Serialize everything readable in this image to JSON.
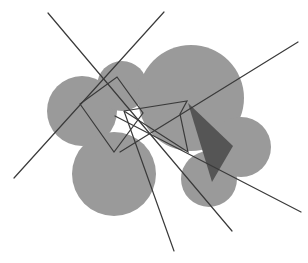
{
  "figure": {
    "title": "",
    "width": 308,
    "height": 263,
    "background_color": "#ffffff"
  },
  "colors": {
    "disc_fill": "#9a9a9a",
    "dark_triangle_fill": "#555555",
    "line_stroke": "#3a3a3a",
    "polygon_stroke": "#3a3a3a",
    "background": "#ffffff"
  },
  "chart_data": {
    "type": "scatter",
    "title": "",
    "xlabel": "",
    "ylabel": "",
    "xlim": [
      0,
      308
    ],
    "ylim": [
      0,
      263
    ],
    "grid": false,
    "legend": null,
    "discs": [
      {
        "name": "disc-left",
        "cx": 82,
        "cy": 111,
        "r": 35
      },
      {
        "name": "disc-top-small",
        "cx": 122,
        "cy": 86,
        "r": 25
      },
      {
        "name": "disc-top-right-large",
        "cx": 191,
        "cy": 98,
        "r": 53
      },
      {
        "name": "disc-bottom-left-large",
        "cx": 114,
        "cy": 174,
        "r": 42
      },
      {
        "name": "disc-bottom-middle",
        "cx": 209,
        "cy": 179,
        "r": 28
      },
      {
        "name": "disc-right",
        "cx": 241,
        "cy": 147,
        "r": 30
      }
    ],
    "dark_triangle": {
      "name": "dark-triangle",
      "points": [
        [
          188,
          103
        ],
        [
          233,
          146
        ],
        [
          212,
          182
        ]
      ]
    },
    "quadrilateral": {
      "name": "quadrilateral-outline",
      "points": [
        [
          80,
          104
        ],
        [
          117,
          77
        ],
        [
          143,
          113
        ],
        [
          114,
          152
        ]
      ],
      "closed": true
    },
    "polygon_chain": {
      "name": "polygon-chain-outline",
      "points": [
        [
          124,
          111
        ],
        [
          187,
          101
        ],
        [
          180,
          114
        ],
        [
          188,
          152
        ],
        [
          124,
          111
        ]
      ],
      "closed": false
    },
    "lines": [
      {
        "name": "line-nw-se",
        "x1": 48,
        "y1": 13,
        "x2": 232,
        "y2": 231
      },
      {
        "name": "line-ne-sw",
        "x1": 164,
        "y1": 12,
        "x2": 14,
        "y2": 178
      },
      {
        "name": "line-upper-right-lower-left",
        "x1": 298,
        "y1": 42,
        "x2": 120,
        "y2": 152
      },
      {
        "name": "line-center-to-bottom",
        "x1": 124,
        "y1": 111,
        "x2": 174,
        "y2": 251
      },
      {
        "name": "line-center-to-right-bottom",
        "x1": 115,
        "y1": 116,
        "x2": 301,
        "y2": 212
      }
    ]
  }
}
